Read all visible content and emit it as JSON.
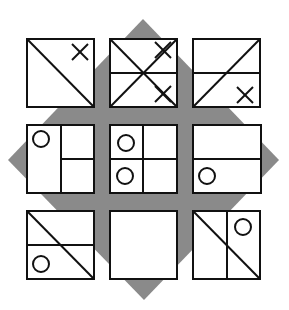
{
  "puzzle": {
    "background_color": "#ffffff",
    "diamond": {
      "color": "#8a8a8a",
      "points": [
        [
          143,
          19
        ],
        [
          279,
          160
        ],
        [
          144,
          300
        ],
        [
          8,
          160
        ]
      ]
    },
    "stroke_color": "#111111",
    "cell_fill": "#ffffff",
    "cells": [
      {
        "id": "r1c1",
        "box": [
          27,
          39,
          94,
          107
        ],
        "lines": [
          [
            27,
            39,
            94,
            107
          ]
        ],
        "crosses": [
          [
            80,
            52
          ]
        ],
        "circles": []
      },
      {
        "id": "r1c2",
        "box": [
          110,
          39,
          177,
          107
        ],
        "lines": [
          [
            110,
            39,
            177,
            107
          ],
          [
            110,
            107,
            177,
            39
          ],
          [
            110,
            73,
            177,
            73
          ]
        ],
        "crosses": [
          [
            163,
            50
          ],
          [
            163,
            94
          ]
        ],
        "circles": []
      },
      {
        "id": "r1c3",
        "box": [
          193,
          39,
          260,
          107
        ],
        "lines": [
          [
            193,
            107,
            260,
            39
          ],
          [
            193,
            73,
            260,
            73
          ]
        ],
        "crosses": [
          [
            245,
            95
          ]
        ],
        "circles": []
      },
      {
        "id": "r2c1",
        "box": [
          27,
          125,
          94,
          193
        ],
        "lines": [
          [
            61,
            125,
            61,
            193
          ],
          [
            61,
            159,
            94,
            159
          ]
        ],
        "crosses": [],
        "circles": [
          [
            41,
            139
          ]
        ]
      },
      {
        "id": "r2c2",
        "box": [
          110,
          125,
          177,
          193
        ],
        "lines": [
          [
            143,
            125,
            143,
            193
          ],
          [
            110,
            159,
            177,
            159
          ]
        ],
        "crosses": [],
        "circles": [
          [
            126,
            143
          ],
          [
            125,
            176
          ]
        ]
      },
      {
        "id": "r2c3",
        "box": [
          193,
          125,
          261,
          193
        ],
        "lines": [
          [
            193,
            159,
            261,
            159
          ]
        ],
        "crosses": [],
        "circles": [
          [
            207,
            176
          ]
        ]
      },
      {
        "id": "r3c1",
        "box": [
          27,
          211,
          94,
          279
        ],
        "lines": [
          [
            27,
            211,
            94,
            279
          ],
          [
            27,
            245,
            94,
            245
          ]
        ],
        "crosses": [],
        "circles": [
          [
            41,
            264
          ]
        ]
      },
      {
        "id": "r3c2",
        "box": [
          110,
          211,
          177,
          279
        ],
        "lines": [],
        "crosses": [],
        "circles": []
      },
      {
        "id": "r3c3",
        "box": [
          193,
          211,
          260,
          279
        ],
        "lines": [
          [
            193,
            211,
            260,
            279
          ],
          [
            227,
            211,
            227,
            279
          ]
        ],
        "crosses": [],
        "circles": [
          [
            243,
            227
          ]
        ]
      }
    ],
    "cross_half_size": 8,
    "circle_radius": 8,
    "stroke_width": 2
  }
}
